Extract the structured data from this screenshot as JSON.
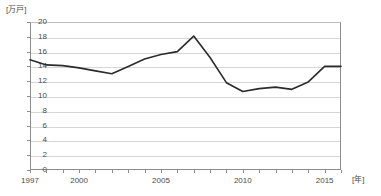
{
  "chart_data": {
    "type": "line",
    "title": "",
    "subtitle": "",
    "xlabel": "[年]",
    "ylabel": "[万戸]",
    "ylim": [
      0,
      20
    ],
    "xlim": [
      1997,
      2016
    ],
    "ytick_step": 2,
    "yticks": [
      "20",
      "18",
      "16",
      "14",
      "12",
      "10",
      "8",
      "6",
      "4",
      "2",
      "0"
    ],
    "xticks_labeled": [
      "1997",
      "2000",
      "2005",
      "2010",
      "2015"
    ],
    "xticks_all": [
      1997,
      1998,
      1999,
      2000,
      2001,
      2002,
      2003,
      2004,
      2005,
      2006,
      2007,
      2008,
      2009,
      2010,
      2011,
      2012,
      2013,
      2014,
      2015,
      2016
    ],
    "grid": true,
    "legend": null,
    "legend_position": "none",
    "series": [
      {
        "name": "住宅着工戸数",
        "color": "#2b2b2b",
        "x": [
          1997,
          1998,
          1999,
          2000,
          2001,
          2002,
          2003,
          2004,
          2005,
          2006,
          2007,
          2008,
          2009,
          2010,
          2011,
          2012,
          2013,
          2014,
          2015,
          2016
        ],
        "values": [
          14.9,
          14.2,
          14.1,
          13.8,
          13.4,
          13.0,
          14.0,
          15.0,
          15.6,
          16.0,
          18.1,
          15.2,
          11.8,
          10.6,
          11.0,
          11.2,
          10.9,
          11.9,
          14.0,
          14.0
        ]
      }
    ]
  },
  "axes": {
    "y_unit_label": "[万戸]",
    "x_unit_label": "[年]"
  },
  "colors": {
    "series": "#2b2b2b",
    "grid": "#d6d6d6",
    "axis": "#8d8d8d",
    "text": "#4a4a4a",
    "background": "#ffffff"
  }
}
